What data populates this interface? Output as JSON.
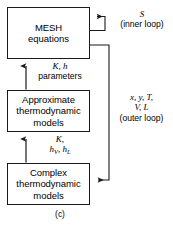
{
  "figure": {
    "caption": "(c)",
    "stroke_color": "#1a1a1a",
    "background_color": "#ffffff",
    "text_color": "#000000"
  },
  "boxes": [
    {
      "id": "mesh-equations",
      "lines": [
        "MESH",
        "equations"
      ]
    },
    {
      "id": "approximate-thermodynamic-models",
      "lines": [
        "Approximate",
        "thermodynamic",
        "models"
      ]
    },
    {
      "id": "complex-thermodynamic-models",
      "lines": [
        "Complex",
        "thermodynamic",
        "models"
      ]
    }
  ],
  "annotations": {
    "k_h_parameters": {
      "line1_italic": "K, h",
      "line2_plain": "parameters"
    },
    "k_hv_hl": {
      "line1_italic": "K,",
      "line2_italic_h": "h",
      "line2_sub_v": "V",
      "line2_mid": ", h",
      "line2_sub_l": "L"
    },
    "inner_loop": {
      "symbol": "S",
      "label": "(inner loop)"
    },
    "outer_loop": {
      "line1": "x, y, T,",
      "line2": "V, L",
      "line3": "(outer loop)"
    }
  }
}
